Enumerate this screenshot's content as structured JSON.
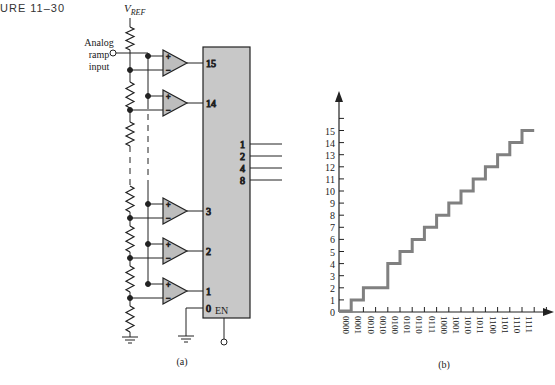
{
  "figure": {
    "label": "URE 11–30",
    "panel_a_caption": "(a)",
    "panel_b_caption": "(b)"
  },
  "circuit": {
    "vref_label": "V",
    "vref_subscript": "REF",
    "input_label_lines": [
      "Analog",
      "ramp",
      "input"
    ],
    "comparator_plus": "+",
    "comparator_minus": "−",
    "encoder_inputs": [
      "15",
      "14",
      "3",
      "2",
      "1",
      "0"
    ],
    "encoder_outputs": [
      "1",
      "2",
      "4",
      "8"
    ],
    "enable_label": "EN",
    "colors": {
      "block_fill": "#c8c8c8",
      "comparator_fill": "#bdbdbd",
      "line": "#222222"
    }
  },
  "chart_data": {
    "type": "line",
    "title": "",
    "xlabel": "",
    "ylabel": "",
    "style": "step",
    "x": [
      "0000",
      "0001",
      "0010",
      "0010",
      "0100",
      "0101",
      "0110",
      "0111",
      "1000",
      "1001",
      "1010",
      "1011",
      "1100",
      "1101",
      "1110",
      "1111"
    ],
    "series": [
      {
        "name": "Encoder output (missing code)",
        "values": [
          0,
          1,
          2,
          2,
          4,
          5,
          6,
          7,
          8,
          9,
          10,
          11,
          12,
          13,
          14,
          15
        ]
      }
    ],
    "yticks": [
      "0",
      "1",
      "2",
      "3",
      "4",
      "5",
      "6",
      "7",
      "8",
      "9",
      "10",
      "11",
      "12",
      "13",
      "14",
      "15"
    ],
    "ylim": [
      0,
      16
    ],
    "grid": false,
    "legend": "none",
    "line_color": "#808080"
  }
}
